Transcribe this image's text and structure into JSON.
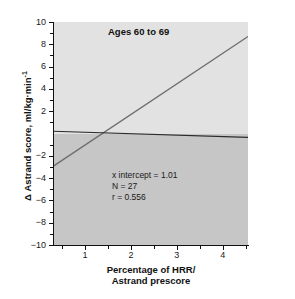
{
  "chart_data": {
    "type": "line",
    "title": "Ages 60 to 69",
    "xlabel_line1": "Percentage of HRR/",
    "xlabel_line2": "Astrand prescore",
    "ylabel": "Δ Astrand score, ml/kg·min",
    "ylabel_exponent": "-1",
    "xlim": [
      0.3,
      4.55
    ],
    "ylim": [
      -10,
      10
    ],
    "grid": false,
    "legend": "none",
    "x_ticks": [
      1,
      2,
      3,
      4
    ],
    "x_tick_labels": [
      "1",
      "2",
      "3",
      "4"
    ],
    "x_minor_ticks": [
      0.5,
      1.5,
      2.5,
      3.5,
      4.5
    ],
    "y_ticks": [
      10,
      8,
      6,
      4,
      2,
      -2,
      -4,
      -6,
      -8,
      -10
    ],
    "y_tick_labels": [
      "10",
      "8",
      "6",
      "4",
      "2",
      "−2",
      "−4",
      "−6",
      "−8",
      "−10"
    ],
    "y_minor_ticks": [
      9,
      7,
      5,
      3,
      1,
      -1,
      -3,
      -5,
      -7,
      -9
    ],
    "series": [
      {
        "name": "regression-line",
        "type": "line",
        "x": [
          0.3,
          4.55
        ],
        "y": [
          -2.95,
          8.7
        ],
        "slope": 2.74,
        "x_intercept": 1.01,
        "color": "#6e6e6e"
      },
      {
        "name": "zero-reference-line",
        "type": "line",
        "x": [
          0.3,
          4.55
        ],
        "y": [
          0.2,
          -0.35
        ],
        "color": "#2b2b2b"
      }
    ],
    "annotations": [
      "x intercept = 1.01",
      "N = 27",
      "r = 0.556"
    ]
  },
  "stats": {
    "x_intercept_label": "x intercept = 1.01",
    "n_label": "N = 27",
    "r_label": "r = 0.556"
  },
  "colors": {
    "plot_background_upper": "#e2e2e2",
    "plot_background_lower": "#c6c6c6",
    "regression_line": "#6e6e6e",
    "reference_line": "#2b2b2b",
    "axis": "#111111",
    "page_background": "#ffffff"
  }
}
